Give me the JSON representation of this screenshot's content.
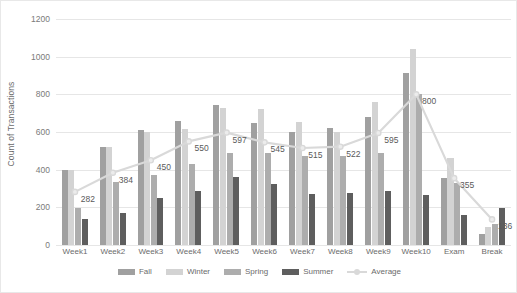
{
  "chart_data": {
    "type": "bar",
    "title": "",
    "xlabel": "",
    "ylabel": "Count of Transactions",
    "ylim": [
      0,
      1200
    ],
    "ytick_step": 200,
    "yticks": [
      0,
      200,
      400,
      600,
      800,
      1000,
      1200
    ],
    "grid": true,
    "legend_position": "bottom",
    "categories": [
      "Week1",
      "Week2",
      "Week3",
      "Week4",
      "Week5",
      "Week6",
      "Week7",
      "Week8",
      "Week9",
      "Week10",
      "Exam",
      "Break"
    ],
    "series": [
      {
        "name": "Fall",
        "type": "bar",
        "color": "#a0a0a0",
        "values": [
          400,
          520,
          610,
          660,
          745,
          650,
          600,
          620,
          680,
          915,
          355,
          60
        ]
      },
      {
        "name": "Winter",
        "type": "bar",
        "color": "#d3d3d3",
        "values": [
          400,
          520,
          600,
          615,
          730,
          720,
          655,
          600,
          760,
          1040,
          460,
          95
        ]
      },
      {
        "name": "Spring",
        "type": "bar",
        "color": "#adadad",
        "values": [
          195,
          335,
          370,
          430,
          490,
          490,
          470,
          470,
          490,
          800,
          330,
          110
        ]
      },
      {
        "name": "Summer",
        "type": "bar",
        "color": "#5e5e5e",
        "values": [
          140,
          170,
          250,
          285,
          360,
          325,
          270,
          275,
          285,
          265,
          160,
          195
        ]
      },
      {
        "name": "Average",
        "type": "line",
        "color": "#d9d9d9",
        "values": [
          282,
          384,
          450,
          550,
          597,
          545,
          515,
          522,
          595,
          800,
          355,
          136
        ],
        "data_labels": [
          "282",
          "384",
          "450",
          "550",
          "597",
          "545",
          "515",
          "522",
          "595",
          "800",
          "355",
          "136"
        ]
      }
    ]
  },
  "legend": {
    "items": [
      {
        "label": "Fall",
        "marker": "bar",
        "color": "#a0a0a0"
      },
      {
        "label": "Winter",
        "marker": "bar",
        "color": "#d3d3d3"
      },
      {
        "label": "Spring",
        "marker": "bar",
        "color": "#adadad"
      },
      {
        "label": "Summer",
        "marker": "bar",
        "color": "#5e5e5e"
      },
      {
        "label": "Average",
        "marker": "line",
        "color": "#d9d9d9"
      }
    ]
  }
}
